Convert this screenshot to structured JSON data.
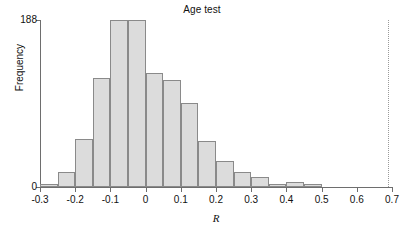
{
  "chart_data": {
    "type": "bar",
    "title": "Age test",
    "xlabel": "R",
    "ylabel": "Frequency",
    "xlim": [
      -0.3,
      0.7
    ],
    "ylim": [
      0,
      188
    ],
    "grid": false,
    "legend": null,
    "bin_width": 0.05,
    "x_ticks": [
      -0.3,
      -0.2,
      -0.1,
      0,
      0.1,
      0.2,
      0.3,
      0.4,
      0.5,
      0.6,
      0.7
    ],
    "x_tick_labels": [
      "-0.3",
      "-0.2",
      "-0.1",
      "0",
      "0.1",
      "0.2",
      "0.3",
      "0.4",
      "0.5",
      "0.6",
      "0.7"
    ],
    "y_ticks": [
      0,
      188
    ],
    "y_tick_labels": [
      "0",
      "188"
    ],
    "bin_edges": [
      -0.3,
      -0.25,
      -0.2,
      -0.15,
      -0.1,
      -0.05,
      0.0,
      0.05,
      0.1,
      0.15,
      0.2,
      0.25,
      0.3,
      0.35,
      0.4,
      0.45,
      0.5
    ],
    "categories": [
      "-0.30 to -0.25",
      "-0.25 to -0.20",
      "-0.20 to -0.15",
      "-0.15 to -0.10",
      "-0.10 to -0.05",
      "-0.05 to 0.00",
      "0.00 to 0.05",
      "0.05 to 0.10",
      "0.10 to 0.15",
      "0.15 to 0.20",
      "0.20 to 0.25",
      "0.25 to 0.30",
      "0.30 to 0.35",
      "0.35 to 0.40",
      "0.40 to 0.45",
      "0.45 to 0.50"
    ],
    "values": [
      3,
      17,
      54,
      123,
      188,
      188,
      128,
      120,
      95,
      52,
      29,
      17,
      11,
      3,
      6,
      3
    ],
    "annotations": [
      {
        "name": "reference-line",
        "type": "vertical-dotted-line",
        "x": 0.69,
        "color": "#9a9a9a"
      }
    ],
    "colors": {
      "bar_fill": "#dcdcdc",
      "bar_edge": "#8a8a8a",
      "axis": "#6e6e6e",
      "text": "#111111",
      "background": "#ffffff"
    }
  }
}
